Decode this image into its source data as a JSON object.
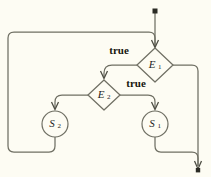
{
  "diagram": {
    "background_color": "#fdfcf3",
    "line_color": "#6f6f63",
    "text_color": "#17170f",
    "nodes": [
      {
        "id": "E1",
        "shape": "diamond",
        "base": "E",
        "subscript": "1",
        "cx": 155,
        "cy": 65,
        "rx": 18,
        "ry": 17
      },
      {
        "id": "E2",
        "shape": "diamond",
        "base": "E",
        "subscript": "2",
        "cx": 104,
        "cy": 95,
        "rx": 16,
        "ry": 15
      },
      {
        "id": "S2",
        "shape": "circle",
        "base": "S",
        "subscript": "2",
        "cx": 55,
        "cy": 124,
        "r": 13
      },
      {
        "id": "S1",
        "shape": "circle",
        "base": "S",
        "subscript": "1",
        "cx": 155,
        "cy": 124,
        "r": 13
      }
    ],
    "edge_labels": [
      {
        "id": "true-e1",
        "text": "true",
        "x": 119,
        "y": 51
      },
      {
        "id": "true-e2",
        "text": "true",
        "x": 136,
        "y": 84
      }
    ],
    "edges": [
      {
        "id": "entry-to-E1",
        "from": "start",
        "to": "E1",
        "label": ""
      },
      {
        "id": "E1-true-to-E2",
        "from": "E1",
        "to": "E2",
        "label": "true"
      },
      {
        "id": "E2-true-to-S1",
        "from": "E2",
        "to": "S1",
        "label": "true"
      },
      {
        "id": "E2-false-to-S2",
        "from": "E2",
        "to": "S2",
        "label": ""
      },
      {
        "id": "E1-false-to-exit",
        "from": "E1",
        "to": "exit",
        "label": ""
      },
      {
        "id": "S2-back-to-top",
        "from": "S2",
        "to": "E1",
        "label": ""
      },
      {
        "id": "S1-to-exit",
        "from": "S1",
        "to": "exit",
        "label": ""
      }
    ],
    "terminals": [
      {
        "id": "start-dot",
        "type": "start",
        "x": 155,
        "y": 11
      },
      {
        "id": "exit-arrow",
        "type": "exit",
        "x": 198,
        "y": 170
      }
    ]
  }
}
